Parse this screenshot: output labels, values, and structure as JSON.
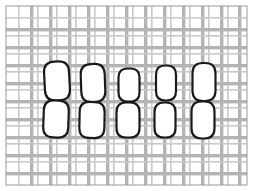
{
  "figure": {
    "type": "diagram",
    "width": 253,
    "height": 191,
    "background_color": "#ffffff"
  },
  "frame": {
    "stroke_color": "#9a9a9a",
    "stroke_width": 1,
    "x": 6,
    "y": 6,
    "width": 241,
    "height": 179
  },
  "weave": {
    "description": "Basket-weave plaid of thin light-gray bands; wide bands paired with narrow bands",
    "band_color_light": "#c9c9c9",
    "band_color_mid": "#b4b4b4",
    "band_color_dark": "#a2a2a2",
    "vertical_bands": [
      {
        "x": 18,
        "width": 1.6,
        "shade": "#c9c9c9"
      },
      {
        "x": 30,
        "width": 3.4,
        "shade": "#b4b4b4"
      },
      {
        "x": 37,
        "width": 1.6,
        "shade": "#c9c9c9"
      },
      {
        "x": 49,
        "width": 3.4,
        "shade": "#b4b4b4"
      },
      {
        "x": 56,
        "width": 1.6,
        "shade": "#c9c9c9"
      },
      {
        "x": 68,
        "width": 3.4,
        "shade": "#b4b4b4"
      },
      {
        "x": 75,
        "width": 1.6,
        "shade": "#c9c9c9"
      },
      {
        "x": 87,
        "width": 3.4,
        "shade": "#b4b4b4"
      },
      {
        "x": 94,
        "width": 1.6,
        "shade": "#c9c9c9"
      },
      {
        "x": 106,
        "width": 3.4,
        "shade": "#b4b4b4"
      },
      {
        "x": 113,
        "width": 1.6,
        "shade": "#c9c9c9"
      },
      {
        "x": 125,
        "width": 3.4,
        "shade": "#b4b4b4"
      },
      {
        "x": 132,
        "width": 1.6,
        "shade": "#c9c9c9"
      },
      {
        "x": 144,
        "width": 3.4,
        "shade": "#b4b4b4"
      },
      {
        "x": 151,
        "width": 1.6,
        "shade": "#c9c9c9"
      },
      {
        "x": 163,
        "width": 3.4,
        "shade": "#b4b4b4"
      },
      {
        "x": 170,
        "width": 1.6,
        "shade": "#c9c9c9"
      },
      {
        "x": 182,
        "width": 3.4,
        "shade": "#b4b4b4"
      },
      {
        "x": 189,
        "width": 1.6,
        "shade": "#c9c9c9"
      },
      {
        "x": 201,
        "width": 3.4,
        "shade": "#b4b4b4"
      },
      {
        "x": 208,
        "width": 1.6,
        "shade": "#c9c9c9"
      },
      {
        "x": 220,
        "width": 3.4,
        "shade": "#b4b4b4"
      },
      {
        "x": 227,
        "width": 1.6,
        "shade": "#c9c9c9"
      },
      {
        "x": 238,
        "width": 3.4,
        "shade": "#b4b4b4"
      }
    ],
    "horizontal_bands": [
      {
        "y": 17,
        "height": 1.6,
        "shade": "#c9c9c9"
      },
      {
        "y": 28,
        "height": 3.4,
        "shade": "#b4b4b4"
      },
      {
        "y": 35,
        "height": 1.6,
        "shade": "#c9c9c9"
      },
      {
        "y": 46,
        "height": 3.4,
        "shade": "#b4b4b4"
      },
      {
        "y": 53,
        "height": 1.6,
        "shade": "#c9c9c9"
      },
      {
        "y": 64,
        "height": 3.4,
        "shade": "#b4b4b4"
      },
      {
        "y": 71,
        "height": 1.6,
        "shade": "#c9c9c9"
      },
      {
        "y": 82,
        "height": 3.4,
        "shade": "#b4b4b4"
      },
      {
        "y": 89,
        "height": 1.6,
        "shade": "#c9c9c9"
      },
      {
        "y": 100,
        "height": 3.4,
        "shade": "#b4b4b4"
      },
      {
        "y": 107,
        "height": 1.6,
        "shade": "#c9c9c9"
      },
      {
        "y": 118,
        "height": 3.4,
        "shade": "#b4b4b4"
      },
      {
        "y": 125,
        "height": 1.6,
        "shade": "#c9c9c9"
      },
      {
        "y": 136,
        "height": 3.4,
        "shade": "#b4b4b4"
      },
      {
        "y": 143,
        "height": 1.6,
        "shade": "#c9c9c9"
      },
      {
        "y": 154,
        "height": 3.4,
        "shade": "#b4b4b4"
      },
      {
        "y": 161,
        "height": 1.6,
        "shade": "#c9c9c9"
      },
      {
        "y": 172,
        "height": 3.4,
        "shade": "#b4b4b4"
      }
    ]
  },
  "shapes": {
    "stroke_color": "#1a1a1a",
    "fill_color": "#ffffff",
    "stroke_width": 2.2,
    "count": 10,
    "pair_count": 5,
    "pairs": [
      {
        "label": "pair-1",
        "upper": {
          "cx": 57,
          "cy": 81,
          "rx": 12.5,
          "ry": 19.5,
          "rotation": -3
        },
        "lower": {
          "cx": 56,
          "cy": 119,
          "rx": 12.5,
          "ry": 18.5,
          "rotation": 2
        }
      },
      {
        "label": "pair-2",
        "upper": {
          "cx": 93,
          "cy": 83,
          "rx": 12.0,
          "ry": 19.0,
          "rotation": -2
        },
        "lower": {
          "cx": 92,
          "cy": 120,
          "rx": 12.5,
          "ry": 18.0,
          "rotation": 1
        }
      },
      {
        "label": "pair-3",
        "upper": {
          "cx": 129,
          "cy": 85,
          "rx": 10.5,
          "ry": 16.5,
          "rotation": 0
        },
        "lower": {
          "cx": 128,
          "cy": 120,
          "rx": 11.5,
          "ry": 17.5,
          "rotation": 0
        }
      },
      {
        "label": "pair-4",
        "upper": {
          "cx": 166,
          "cy": 83,
          "rx": 10.0,
          "ry": 17.5,
          "rotation": 0
        },
        "lower": {
          "cx": 165,
          "cy": 120,
          "rx": 10.5,
          "ry": 17.5,
          "rotation": 0
        }
      },
      {
        "label": "pair-5",
        "upper": {
          "cx": 204,
          "cy": 82,
          "rx": 11.5,
          "ry": 19.0,
          "rotation": 0
        },
        "lower": {
          "cx": 203,
          "cy": 120,
          "rx": 11.5,
          "ry": 18.5,
          "rotation": 0
        }
      }
    ]
  }
}
